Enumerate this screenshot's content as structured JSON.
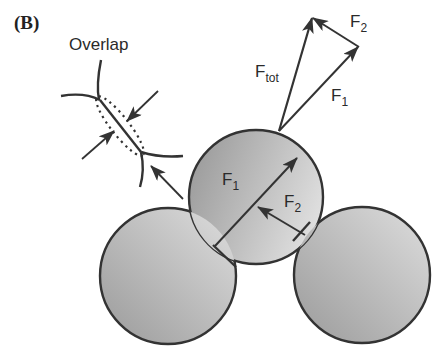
{
  "figure": {
    "panel_label": "(B)",
    "inset": {
      "title": "Overlap"
    },
    "vector_diagram": {
      "labels": {
        "f_tot": {
          "main": "F",
          "sub": "tot"
        },
        "f1": {
          "main": "F",
          "sub": "1"
        },
        "f2": {
          "main": "F",
          "sub": "2"
        }
      }
    },
    "particle_labels": {
      "f1": {
        "main": "F",
        "sub": "1"
      },
      "f2": {
        "main": "F",
        "sub": "2"
      }
    },
    "colors": {
      "outline": "#333333",
      "shade_dark": "#999999",
      "shade_light": "#e0e0e0"
    }
  }
}
